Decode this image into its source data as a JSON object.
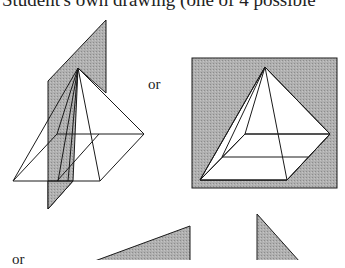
{
  "caption": "Student's own drawing (one of 4 possible",
  "separators": {
    "or_top": "or",
    "or_bottom": "or"
  },
  "figures": [
    {
      "name": "pyramid-with-diagonal-plane",
      "description": "Square pyramid cut by a vertical diagonal shaded plane through apex"
    },
    {
      "name": "pyramid-with-parallel-plane",
      "description": "Square pyramid in front of shaded plane parallel to base edge"
    },
    {
      "name": "cross-section-triangle-1",
      "description": "Shaded triangular cross-section (partially visible)"
    },
    {
      "name": "cross-section-triangle-2",
      "description": "Shaded right-triangle cross-section (partially visible)"
    }
  ],
  "colors": {
    "plane_fill": "#a8a8a8",
    "line": "#1a1a1a",
    "background": "#ffffff"
  }
}
